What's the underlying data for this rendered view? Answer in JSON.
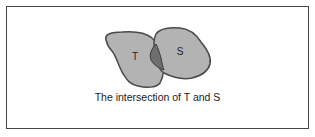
{
  "diagram": {
    "sets": [
      {
        "name": "T",
        "label": "T",
        "fill": "#b3b3b3",
        "stroke": "#4a4a4a"
      },
      {
        "name": "S",
        "label": "S",
        "fill": "#b3b3b3",
        "stroke": "#4a4a4a"
      }
    ],
    "intersection": {
      "fill": "#6e6e6e"
    },
    "caption": "The intersection of T and S"
  }
}
